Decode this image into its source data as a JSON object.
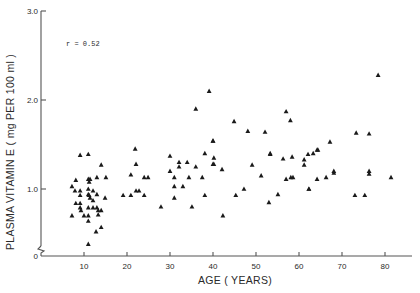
{
  "chart_data": {
    "type": "scatter",
    "title": "",
    "xlabel": "AGE ( YEARS)",
    "ylabel": "PLASMA VITAMIN E ( mg PER 100 ml )",
    "annotation": "r = 0.52",
    "xlim": [
      0,
      85
    ],
    "ylim": [
      0,
      3.0
    ],
    "x_ticks": [
      10,
      20,
      30,
      40,
      50,
      60,
      70,
      80
    ],
    "x_tick_labels": [
      "10",
      "20",
      "30",
      "40",
      "50",
      "60",
      "70",
      "80"
    ],
    "y_ticks": [
      0,
      1.0,
      2.0,
      3.0
    ],
    "y_tick_labels": [
      "0",
      "1.0",
      "2.0",
      "3.0"
    ],
    "y_axis_break": true,
    "grid": false,
    "legend": null,
    "marker": "filled-triangle",
    "marker_color": "#1a1a1a",
    "series": [
      {
        "name": "subjects",
        "points": [
          [
            9.1,
            1.38
          ],
          [
            11.0,
            1.39
          ],
          [
            14.0,
            1.27
          ],
          [
            8.1,
            1.1
          ],
          [
            11.0,
            1.11
          ],
          [
            11.4,
            1.11
          ],
          [
            11.2,
            1.08
          ],
          [
            13.0,
            1.13
          ],
          [
            15.1,
            1.13
          ],
          [
            7.2,
            1.03
          ],
          [
            7.9,
            0.98
          ],
          [
            9.1,
            0.98
          ],
          [
            11.0,
            1.0
          ],
          [
            12.1,
            0.98
          ],
          [
            9.1,
            0.93
          ],
          [
            11.0,
            0.94
          ],
          [
            11.2,
            0.93
          ],
          [
            13.0,
            0.94
          ],
          [
            11.4,
            0.9
          ],
          [
            14.9,
            0.9
          ],
          [
            12.1,
            0.87
          ],
          [
            8.1,
            0.84
          ],
          [
            9.1,
            0.84
          ],
          [
            9.1,
            0.79
          ],
          [
            9.3,
            0.76
          ],
          [
            11.0,
            0.79
          ],
          [
            12.1,
            0.79
          ],
          [
            13.0,
            0.79
          ],
          [
            13.3,
            0.76
          ],
          [
            14.0,
            0.76
          ],
          [
            7.2,
            0.7
          ],
          [
            10.0,
            0.7
          ],
          [
            11.0,
            0.7
          ],
          [
            13.3,
            0.71
          ],
          [
            11.0,
            0.64
          ],
          [
            14.0,
            0.57
          ],
          [
            12.8,
            0.52
          ],
          [
            11.0,
            0.38
          ],
          [
            21.9,
            1.45
          ],
          [
            22.1,
            1.28
          ],
          [
            20.9,
            1.16
          ],
          [
            24.0,
            1.13
          ],
          [
            24.9,
            1.13
          ],
          [
            19.1,
            0.93
          ],
          [
            20.9,
            0.93
          ],
          [
            22.1,
            0.98
          ],
          [
            22.8,
            0.98
          ],
          [
            24.0,
            0.93
          ],
          [
            27.9,
            0.8
          ],
          [
            30.0,
            1.37
          ],
          [
            36.0,
            1.9
          ],
          [
            38.1,
            1.4
          ],
          [
            34.0,
            1.3
          ],
          [
            40.0,
            1.54
          ],
          [
            32.1,
            1.3
          ],
          [
            32.1,
            1.25
          ],
          [
            36.0,
            1.25
          ],
          [
            40.0,
            1.28
          ],
          [
            30.0,
            1.2
          ],
          [
            31.0,
            1.13
          ],
          [
            34.4,
            1.13
          ],
          [
            37.5,
            1.13
          ],
          [
            31.0,
            1.03
          ],
          [
            33.0,
            1.03
          ],
          [
            31.0,
            0.9
          ],
          [
            38.1,
            0.93
          ],
          [
            35.1,
            0.8
          ],
          [
            39.1,
            2.1
          ],
          [
            44.9,
            1.76
          ],
          [
            48.1,
            1.65
          ],
          [
            52.1,
            1.64
          ],
          [
            40.0,
            1.54
          ],
          [
            40.2,
            1.35
          ],
          [
            40.2,
            1.28
          ],
          [
            42.1,
            1.22
          ],
          [
            49.1,
            1.27
          ],
          [
            51.2,
            1.15
          ],
          [
            47.2,
            1.0
          ],
          [
            45.3,
            0.93
          ],
          [
            42.3,
            0.7
          ],
          [
            53.0,
            0.85
          ],
          [
            53.3,
            1.39
          ],
          [
            57.0,
            1.87
          ],
          [
            58.0,
            1.77
          ],
          [
            53.3,
            1.4
          ],
          [
            56.3,
            1.34
          ],
          [
            58.4,
            1.36
          ],
          [
            61.2,
            1.33
          ],
          [
            62.1,
            1.39
          ],
          [
            63.3,
            1.4
          ],
          [
            64.2,
            1.44
          ],
          [
            61.2,
            1.27
          ],
          [
            57.0,
            1.11
          ],
          [
            58.1,
            1.13
          ],
          [
            64.2,
            1.11
          ],
          [
            62.3,
            1.0
          ],
          [
            55.1,
            0.94
          ],
          [
            78.4,
            2.28
          ],
          [
            73.3,
            1.63
          ],
          [
            76.3,
            1.62
          ],
          [
            67.2,
            1.53
          ],
          [
            64.4,
            1.44
          ],
          [
            68.1,
            1.2
          ],
          [
            68.1,
            1.18
          ],
          [
            76.3,
            1.2
          ],
          [
            76.3,
            1.17
          ],
          [
            81.4,
            1.13
          ],
          [
            66.3,
            1.13
          ],
          [
            62.3,
            1.0
          ],
          [
            73.0,
            0.93
          ],
          [
            75.3,
            0.93
          ],
          [
            58.6,
            1.13
          ]
        ]
      }
    ]
  }
}
